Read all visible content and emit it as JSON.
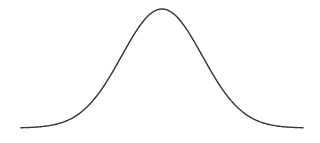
{
  "chart_data": {
    "type": "line",
    "title": "",
    "subtitle": "",
    "xlabel": "",
    "ylabel": "",
    "distribution": "normal",
    "mean": 0,
    "std": 1,
    "x": [
      -3.5,
      -3.0,
      -2.5,
      -2.0,
      -1.5,
      -1.0,
      -0.5,
      0.0,
      0.5,
      1.0,
      1.5,
      2.0,
      2.5,
      3.0,
      3.5
    ],
    "series": [
      {
        "name": "density",
        "values": [
          0.0009,
          0.0044,
          0.0175,
          0.054,
          0.1295,
          0.242,
          0.3521,
          0.3989,
          0.3521,
          0.242,
          0.1295,
          0.054,
          0.0175,
          0.0044,
          0.0009
        ]
      }
    ],
    "xlim": [
      -3.5,
      3.5
    ],
    "ylim": [
      0,
      0.4
    ],
    "grid": false,
    "axes_visible": false,
    "legend": null,
    "colors": {
      "line": "#333333",
      "background": "#ffffff"
    }
  },
  "layout": {
    "plot_left": 21,
    "plot_right": 303,
    "baseline_y": 128,
    "peak_y": 9
  }
}
